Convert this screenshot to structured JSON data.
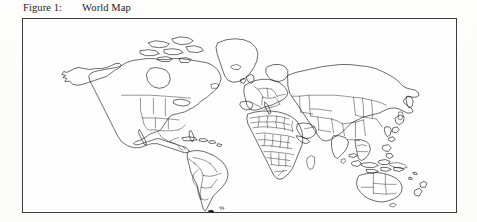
{
  "document": {
    "background_color": "#fdfdfc",
    "ink_color": "#111111"
  },
  "caption": {
    "label": "Figure 1:",
    "title": "World Map"
  },
  "figure": {
    "name": "world-map",
    "border_color": "#3a3a3a",
    "fill_color": "#fefefe",
    "description": "World Map",
    "regions": [
      "North America",
      "Greenland",
      "South America",
      "Europe",
      "Africa",
      "Asia",
      "Australia",
      "New Zealand",
      "Madagascar",
      "Japan",
      "Indonesia",
      "British Isles",
      "Iceland"
    ]
  }
}
